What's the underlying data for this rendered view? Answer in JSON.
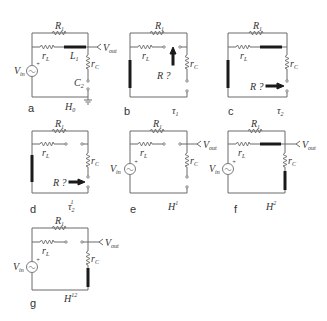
{
  "figure": {
    "panels": [
      {
        "id": "a",
        "label": "a",
        "caption": "H",
        "caption_sub": "0",
        "caption_sup": "",
        "has_source": true,
        "has_vout": true,
        "has_ground": true,
        "open_series": false,
        "open_cap": true,
        "inductor_series": true,
        "inductor_left": false,
        "cap_shorted": false,
        "probe": "",
        "labels": {
          "R1": "R",
          "R1_sub": "1",
          "rL": "r",
          "rL_sub": "L",
          "L1": "L",
          "L1_sub": "1",
          "rC": "r",
          "rC_sub": "C",
          "C2": "C",
          "C2_sub": "2",
          "Vin": "V",
          "Vin_sub": "in",
          "Vout": "V",
          "Vout_sub": "out"
        }
      },
      {
        "id": "b",
        "label": "b",
        "caption": "τ",
        "caption_sub": "1",
        "caption_sup": "",
        "has_source": false,
        "has_vout": false,
        "has_ground": false,
        "open_series": true,
        "open_cap": true,
        "inductor_series": false,
        "inductor_left": true,
        "probe": "up",
        "probe_label": "R ?"
      },
      {
        "id": "c",
        "label": "c",
        "caption": "τ",
        "caption_sub": "2",
        "caption_sup": "",
        "has_source": false,
        "has_vout": false,
        "has_ground": false,
        "open_series": false,
        "open_cap": true,
        "inductor_series": true,
        "inductor_left": true,
        "probe": "right",
        "probe_label": "R ?"
      },
      {
        "id": "d",
        "label": "d",
        "caption": "τ",
        "caption_sub": "2",
        "caption_sup": "1",
        "has_source": false,
        "has_vout": false,
        "open_series": true,
        "open_cap": true,
        "inductor_left": true,
        "probe": "right",
        "probe_label": "R ?"
      },
      {
        "id": "e",
        "label": "e",
        "caption": "H",
        "caption_sub": "",
        "caption_sup": "1",
        "has_source": true,
        "has_vout": true,
        "open_series": true,
        "open_cap": true,
        "inductor_left": false
      },
      {
        "id": "f",
        "label": "f",
        "caption": "H",
        "caption_sub": "",
        "caption_sup": "2",
        "has_source": true,
        "has_vout": true,
        "open_series": false,
        "inductor_series": true,
        "cap_shorted": true
      },
      {
        "id": "g",
        "label": "g",
        "caption": "H",
        "caption_sub": "",
        "caption_sup": "12",
        "has_source": true,
        "has_vout": true,
        "open_series": true,
        "cap_shorted": true
      }
    ],
    "symbols": {
      "R1": "R",
      "R1_sub": "1",
      "rL": "r",
      "rL_sub": "L",
      "rC": "r",
      "rC_sub": "C",
      "L1": "L",
      "L1_sub": "1",
      "C2": "C",
      "C2_sub": "2",
      "Vin": "V",
      "Vin_sub": "in",
      "Vout": "V",
      "Vout_sub": "out",
      "probe": "R ?",
      "plus": "+"
    },
    "colors": {
      "wire": "#6b6b6b",
      "component": "#1a1a1a",
      "text": "#333333"
    }
  }
}
